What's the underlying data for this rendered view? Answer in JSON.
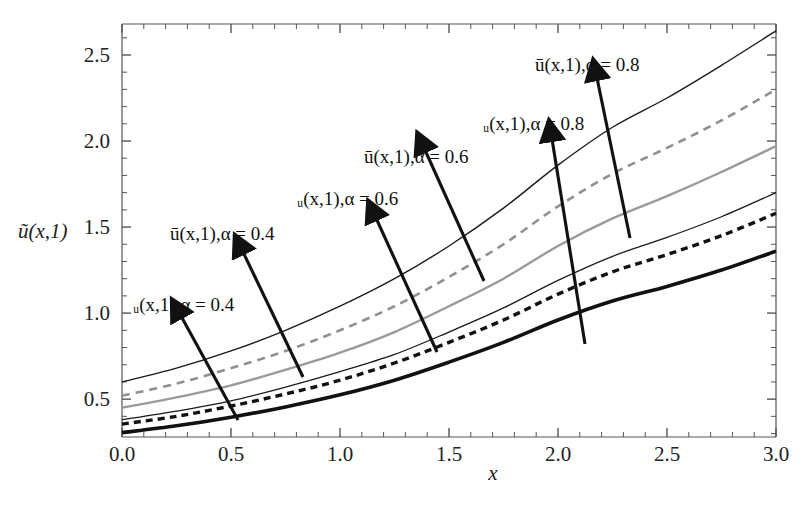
{
  "figure": {
    "kind": "line-plot",
    "background": "#ffffff",
    "frame_color": "#444444"
  },
  "axes": {
    "x_label": "x",
    "y_label": "ũ(x,1)",
    "x_ticks": [
      "0.0",
      "0.5",
      "1.0",
      "1.5",
      "2.0",
      "2.5",
      "3.0"
    ],
    "y_ticks": [
      "0.5",
      "1.0",
      "1.5",
      "2.0",
      "2.5"
    ]
  },
  "annotations": [
    {
      "id": "lower-alpha-04",
      "text": "ᵤ(x,1),α = 0.4",
      "bound": "u_lower",
      "alpha": 0.4
    },
    {
      "id": "upper-alpha-04",
      "text": "ū(x,1),α = 0.4",
      "bound": "u_upper",
      "alpha": 0.4
    },
    {
      "id": "lower-alpha-06",
      "text": "ᵤ(x,1),α = 0.6",
      "bound": "u_lower",
      "alpha": 0.6
    },
    {
      "id": "upper-alpha-06",
      "text": "ū(x,1),α = 0.6",
      "bound": "u_upper",
      "alpha": 0.6
    },
    {
      "id": "lower-alpha-08",
      "text": "ᵤ(x,1),α = 0.8",
      "bound": "u_lower",
      "alpha": 0.8
    },
    {
      "id": "upper-alpha-08",
      "text": "ū(x,1),α = 0.8",
      "bound": "u_upper",
      "alpha": 0.8
    }
  ],
  "chart_data": {
    "type": "line",
    "title": "",
    "xlabel": "x",
    "ylabel": "ũ(x,1)",
    "xlim": [
      0.0,
      3.0
    ],
    "ylim": [
      0.28,
      2.68
    ],
    "grid": false,
    "legend": "inline-arrow-annotations",
    "x": [
      0.0,
      0.25,
      0.5,
      0.75,
      1.0,
      1.25,
      1.5,
      1.75,
      2.0,
      2.25,
      2.5,
      2.75,
      3.0
    ],
    "series": [
      {
        "name": "ū(x,1), α = 0.8",
        "bound": "upper",
        "alpha": 0.8,
        "style": "solid",
        "color": "#1a1a1a",
        "width": 1.4,
        "values": [
          0.6,
          0.68,
          0.78,
          0.9,
          1.04,
          1.2,
          1.39,
          1.61,
          1.86,
          2.08,
          2.25,
          2.44,
          2.64
        ]
      },
      {
        "name": "ū(x,1), α = 0.6",
        "bound": "upper",
        "alpha": 0.6,
        "style": "dashed",
        "color": "#909090",
        "width": 2.6,
        "values": [
          0.52,
          0.59,
          0.68,
          0.78,
          0.9,
          1.04,
          1.21,
          1.4,
          1.62,
          1.81,
          1.96,
          2.12,
          2.3
        ]
      },
      {
        "name": "ū(x,1), α = 0.4",
        "bound": "upper",
        "alpha": 0.4,
        "style": "solid",
        "color": "#9a9a9a",
        "width": 2.4,
        "values": [
          0.45,
          0.51,
          0.58,
          0.67,
          0.77,
          0.89,
          1.04,
          1.2,
          1.39,
          1.55,
          1.68,
          1.82,
          1.97
        ]
      },
      {
        "name": "ᵤ(x,1), α = 0.8",
        "bound": "lower",
        "alpha": 0.8,
        "style": "solid",
        "color": "#1a1a1a",
        "width": 1.3,
        "values": [
          0.38,
          0.43,
          0.49,
          0.57,
          0.66,
          0.76,
          0.89,
          1.03,
          1.19,
          1.33,
          1.44,
          1.56,
          1.7
        ]
      },
      {
        "name": "ᵤ(x,1), α = 0.6",
        "bound": "lower",
        "alpha": 0.6,
        "style": "dashed",
        "color": "#111111",
        "width": 3.4,
        "values": [
          0.355,
          0.4,
          0.46,
          0.53,
          0.61,
          0.71,
          0.83,
          0.96,
          1.11,
          1.24,
          1.34,
          1.45,
          1.58
        ]
      },
      {
        "name": "ᵤ(x,1), α = 0.4",
        "bound": "lower",
        "alpha": 0.4,
        "style": "solid",
        "color": "#111111",
        "width": 3.6,
        "values": [
          0.305,
          0.345,
          0.395,
          0.455,
          0.525,
          0.61,
          0.715,
          0.83,
          0.96,
          1.07,
          1.155,
          1.25,
          1.36
        ]
      }
    ]
  }
}
